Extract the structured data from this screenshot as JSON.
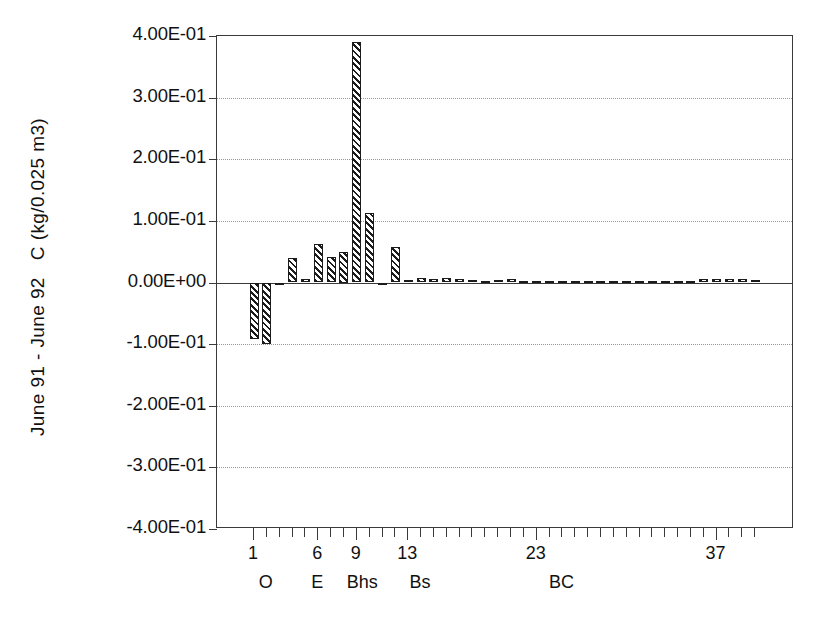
{
  "chart_data": {
    "type": "bar",
    "title": "",
    "subtitle": "",
    "xlabel": "",
    "ylabel": "June 91 - June 92   C (kg/0.025 m3)",
    "ylim": [
      -0.4,
      0.4
    ],
    "ytick_labels": [
      "4.00E-01",
      "3.00E-01",
      "2.00E-01",
      "1.00E-01",
      "0.00E+00",
      "-1.00E-01",
      "-2.00E-01",
      "-3.00E-01",
      "-4.00E-01"
    ],
    "ytick_values": [
      0.4,
      0.3,
      0.2,
      0.1,
      0.0,
      -0.1,
      -0.2,
      -0.3,
      -0.4
    ],
    "xtick_labels": [
      "1",
      "6",
      "9",
      "13",
      "23",
      "37"
    ],
    "xtick_values": [
      1,
      6,
      9,
      13,
      23,
      37
    ],
    "grid": "horizontal-dotted",
    "legend": "none",
    "zero_line": true,
    "horizon_groups": [
      {
        "label": "O",
        "center_index": 2
      },
      {
        "label": "E",
        "center_index": 6
      },
      {
        "label": "Bhs",
        "center_index": 9.5
      },
      {
        "label": "Bs",
        "center_index": 14
      },
      {
        "label": "BC",
        "center_index": 25
      }
    ],
    "categories": [
      1,
      2,
      3,
      4,
      5,
      6,
      7,
      8,
      9,
      10,
      11,
      12,
      13,
      14,
      15,
      16,
      17,
      18,
      19,
      20,
      21,
      22,
      23,
      24,
      25,
      26,
      27,
      28,
      29,
      30,
      31,
      32,
      33,
      34,
      35,
      36,
      37,
      38,
      39,
      40
    ],
    "values": [
      -0.092,
      -0.1,
      -0.004,
      0.04,
      0.005,
      0.062,
      0.042,
      0.05,
      0.39,
      0.113,
      -0.003,
      0.058,
      0.004,
      0.007,
      0.005,
      0.007,
      0.006,
      0.004,
      0.003,
      0.004,
      0.006,
      0.003,
      0.003,
      0.002,
      0.002,
      0.002,
      0.002,
      0.002,
      0.002,
      0.002,
      0.002,
      0.002,
      0.002,
      0.002,
      0.002,
      0.006,
      0.006,
      0.006,
      0.006,
      0.004
    ]
  }
}
